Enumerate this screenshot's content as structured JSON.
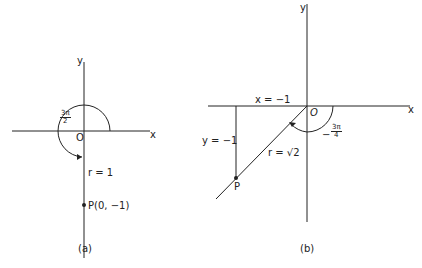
{
  "figure_a": {
    "caption": "(a)",
    "x_axis_label": "x",
    "y_axis_label": "y",
    "origin_label": "O",
    "angle": {
      "num": "3π",
      "den": "2"
    },
    "radius_label": "r = 1",
    "point_label": "P(0, −1)"
  },
  "figure_b": {
    "caption": "(b)",
    "x_axis_label": "x",
    "y_axis_label": "y",
    "origin_label": "O",
    "x_line_label": "x = −1",
    "y_line_label": "y = −1",
    "angle": {
      "sign": "−",
      "num": "3π",
      "den": "4"
    },
    "radius_label": "r = √2",
    "point_label": "P"
  },
  "colors": {
    "line": "#222222",
    "background": "#ffffff"
  }
}
